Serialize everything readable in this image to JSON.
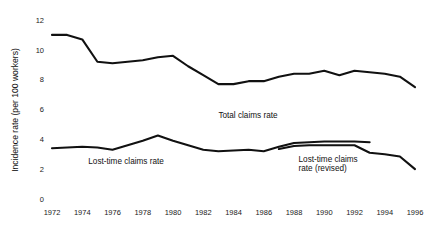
{
  "chart_data": {
    "type": "line",
    "title": "",
    "xlabel": "",
    "ylabel": "Incidence rate (per 100 workers)",
    "xlim": [
      1972,
      1996
    ],
    "ylim": [
      0,
      12
    ],
    "y_ticks": [
      0,
      2,
      4,
      6,
      8,
      10,
      12
    ],
    "x_ticks": [
      1972,
      1974,
      1976,
      1978,
      1980,
      1982,
      1984,
      1986,
      1988,
      1990,
      1992,
      1994,
      1996
    ],
    "grid": false,
    "legend": "annotations-inline",
    "x": [
      1972,
      1973,
      1974,
      1975,
      1976,
      1977,
      1978,
      1979,
      1980,
      1981,
      1982,
      1983,
      1984,
      1985,
      1986,
      1987,
      1988,
      1989,
      1990,
      1991,
      1992,
      1993,
      1994,
      1995,
      1996
    ],
    "series": [
      {
        "name": "Total claims rate",
        "annotation": "Total claims rate",
        "x": [
          1972,
          1973,
          1974,
          1975,
          1976,
          1977,
          1978,
          1979,
          1980,
          1981,
          1982,
          1983,
          1984,
          1985,
          1986,
          1987,
          1988,
          1989,
          1990,
          1991,
          1992,
          1993,
          1994,
          1995,
          1996
        ],
        "values": [
          11.0,
          11.0,
          10.7,
          9.2,
          9.1,
          9.2,
          9.3,
          9.5,
          9.6,
          8.9,
          8.3,
          7.7,
          7.7,
          7.9,
          7.9,
          8.2,
          8.4,
          8.4,
          8.6,
          8.3,
          8.6,
          8.5,
          8.4,
          8.2,
          7.5
        ]
      },
      {
        "name": "Lost-time claims rate",
        "annotation": "Lost-time claims rate",
        "x": [
          1972,
          1973,
          1974,
          1975,
          1976,
          1977,
          1978,
          1979,
          1980,
          1981,
          1982,
          1983,
          1984,
          1985,
          1986,
          1987,
          1988,
          1989,
          1990,
          1991,
          1992,
          1993
        ],
        "values": [
          3.4,
          3.45,
          3.5,
          3.45,
          3.3,
          3.6,
          3.9,
          4.25,
          3.9,
          3.6,
          3.3,
          3.2,
          3.25,
          3.3,
          3.2,
          3.5,
          3.75,
          3.8,
          3.85,
          3.85,
          3.85,
          3.8
        ]
      },
      {
        "name": "Lost-time claims rate (revised)",
        "annotation": "Lost-time claims\nrate (revised)",
        "x": [
          1987,
          1988,
          1989,
          1990,
          1991,
          1992,
          1993,
          1994,
          1995,
          1996
        ],
        "values": [
          3.35,
          3.55,
          3.6,
          3.6,
          3.6,
          3.6,
          3.1,
          3.0,
          2.85,
          2.0
        ]
      }
    ],
    "annotations": [
      {
        "text": "Total claims rate",
        "x": 1983.0,
        "y": 5.4
      },
      {
        "text": "Lost-time claims rate",
        "x": 1974.4,
        "y": 2.35
      },
      {
        "text": "Lost-time claims",
        "x": 1988.3,
        "y": 2.45
      },
      {
        "text": "rate (revised)",
        "x": 1988.3,
        "y": 1.85
      }
    ]
  },
  "axes": {
    "y_axis_title": "Incidence rate (per 100 workers)",
    "y_tick_labels": [
      "12",
      "10",
      "8",
      "6",
      "4",
      "2",
      "0"
    ],
    "x_tick_labels": [
      "1972",
      "1974",
      "1976",
      "1978",
      "1980",
      "1982",
      "1984",
      "1986",
      "1988",
      "1990",
      "1992",
      "1994",
      "1996"
    ]
  },
  "style": {
    "line_color": "#111111",
    "text_color": "#111111",
    "background": "#ffffff"
  }
}
